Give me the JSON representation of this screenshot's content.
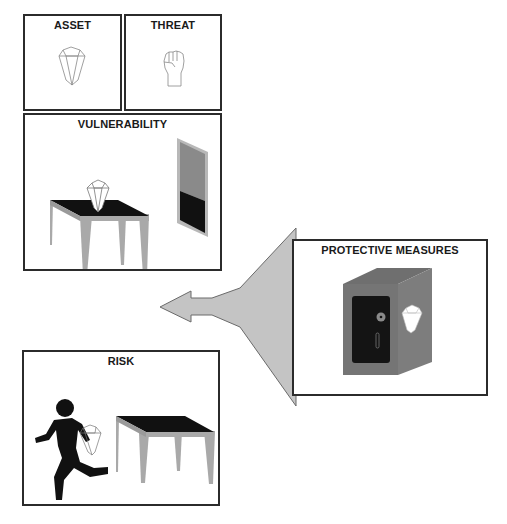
{
  "diagram": {
    "panels": {
      "asset": {
        "title": "ASSET",
        "icon": "gem-icon"
      },
      "threat": {
        "title": "THREAT",
        "icon": "raised-fist-icon"
      },
      "vulnerability": {
        "title": "VULNERABILITY",
        "icons": [
          "table-icon",
          "gem-icon",
          "open-window-icon"
        ]
      },
      "protective_measures": {
        "title": "PROTECTIVE MEASURES",
        "icons": [
          "safe-icon",
          "gem-icon"
        ]
      },
      "risk": {
        "title": "RISK",
        "icons": [
          "running-thief-icon",
          "gem-icon",
          "empty-table-icon"
        ]
      }
    },
    "arrow": {
      "direction": "left",
      "from": "protective_measures",
      "icon": "arrow-left-icon"
    },
    "colors": {
      "border": "#2b2b2b",
      "gray_fill": "#a9a9a9",
      "safe_gray": "#7a7a7a",
      "dark": "#111111",
      "arrow_fill": "#c4c4c4"
    }
  }
}
